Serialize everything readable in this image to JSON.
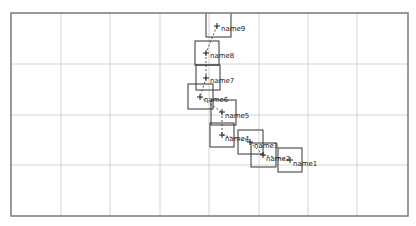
{
  "plot": {
    "frame": {
      "left": 11,
      "top": 13,
      "right": 408,
      "bottom": 216,
      "color": "#7a7a7a"
    },
    "grid": {
      "color": "#d4d4d4",
      "x": [
        61,
        110,
        160,
        209,
        259,
        308,
        357
      ],
      "y": [
        64,
        115,
        165
      ]
    }
  },
  "nodes": [
    {
      "id": "name9",
      "label": "name9",
      "box": [
        206,
        10,
        25,
        27
      ],
      "marker": [
        217,
        26
      ],
      "text": [
        221,
        31
      ]
    },
    {
      "id": "name8",
      "label": "name8",
      "box": [
        195,
        41,
        24,
        24
      ],
      "marker": [
        206,
        53
      ],
      "text": [
        210,
        58
      ]
    },
    {
      "id": "name7",
      "label": "name7",
      "box": [
        196,
        65,
        24,
        25
      ],
      "marker": [
        206,
        78
      ],
      "text": [
        210,
        83
      ]
    },
    {
      "id": "name6",
      "label": "name6",
      "box": [
        188,
        84,
        25,
        25
      ],
      "marker": [
        200,
        97
      ],
      "text": [
        204,
        102
      ]
    },
    {
      "id": "name5",
      "label": "name5",
      "box": [
        211,
        100,
        25,
        25
      ],
      "marker": [
        222,
        112
      ],
      "text": [
        225,
        118
      ]
    },
    {
      "id": "name4",
      "label": "name4",
      "box": [
        210,
        123,
        24,
        24
      ],
      "marker": [
        222,
        135
      ],
      "text": [
        225,
        141
      ]
    },
    {
      "id": "name3",
      "label": "name3",
      "box": [
        238,
        130,
        25,
        24
      ],
      "marker": [
        250,
        142
      ],
      "text": [
        254,
        148
      ]
    },
    {
      "id": "name2",
      "label": "name2",
      "box": [
        251,
        143,
        25,
        24
      ],
      "marker": [
        263,
        155
      ],
      "text": [
        266,
        161
      ]
    },
    {
      "id": "name1",
      "label": "name1",
      "box": [
        278,
        148,
        24,
        24
      ],
      "marker": [
        290,
        160
      ],
      "text": [
        293,
        166
      ]
    }
  ],
  "links": [
    [
      "name9",
      "name8"
    ],
    [
      "name8",
      "name7"
    ],
    [
      "name7",
      "name6"
    ],
    [
      "name6",
      "name5"
    ],
    [
      "name5",
      "name4"
    ],
    [
      "name4",
      "name3"
    ],
    [
      "name3",
      "name2"
    ],
    [
      "name2",
      "name1"
    ]
  ],
  "colors": {
    "box": "#333333",
    "link": "#555555",
    "marker": "#222222"
  }
}
